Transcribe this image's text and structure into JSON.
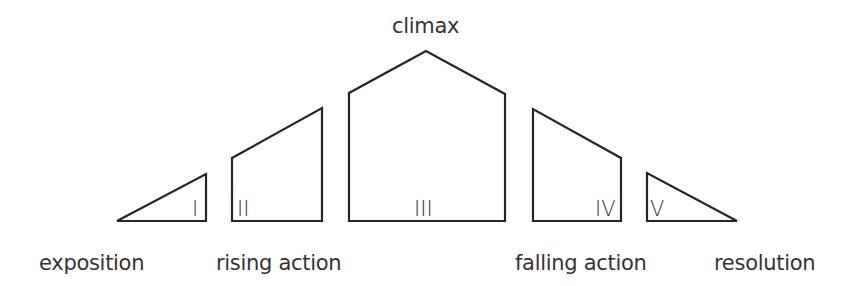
{
  "diagram": {
    "title_label": "climax",
    "colors": {
      "stroke": "#262626",
      "text": "#333333",
      "background": "#ffffff"
    },
    "stages": [
      {
        "numeral": "I",
        "label": "exposition",
        "points": "117,221 206,174 206,221"
      },
      {
        "numeral": "II",
        "label": "rising action",
        "points": "232,221 232,158 322,108 322,221"
      },
      {
        "numeral": "III",
        "label": "",
        "points": "349,221 349,93 426,51 505,94 505,221"
      },
      {
        "numeral": "IV",
        "label": "falling action",
        "points": "533,221 533,109 621,158 621,221"
      },
      {
        "numeral": "V",
        "label": "resolution",
        "points": "647,221 647,173 737,221"
      }
    ]
  }
}
